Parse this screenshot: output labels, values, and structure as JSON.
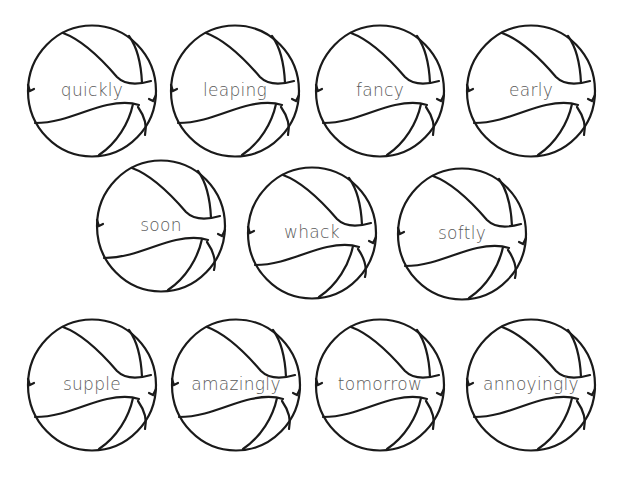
{
  "worksheet": {
    "line_color": "#1a1a1a",
    "text_color": "#5a5a5a",
    "balls": [
      {
        "word": "quickly",
        "cx": 92,
        "cy": 91
      },
      {
        "word": "leaping",
        "cx": 235,
        "cy": 91
      },
      {
        "word": "fancy",
        "cx": 380,
        "cy": 91
      },
      {
        "word": "early",
        "cx": 531,
        "cy": 91
      },
      {
        "word": "soon",
        "cx": 161,
        "cy": 226
      },
      {
        "word": "whack",
        "cx": 312,
        "cy": 233
      },
      {
        "word": "softly",
        "cx": 462,
        "cy": 234
      },
      {
        "word": "supple",
        "cx": 92,
        "cy": 385
      },
      {
        "word": "amazingly",
        "cx": 236,
        "cy": 385
      },
      {
        "word": "tomorrow",
        "cx": 380,
        "cy": 385
      },
      {
        "word": "annoyingly",
        "cx": 531,
        "cy": 385
      }
    ]
  }
}
